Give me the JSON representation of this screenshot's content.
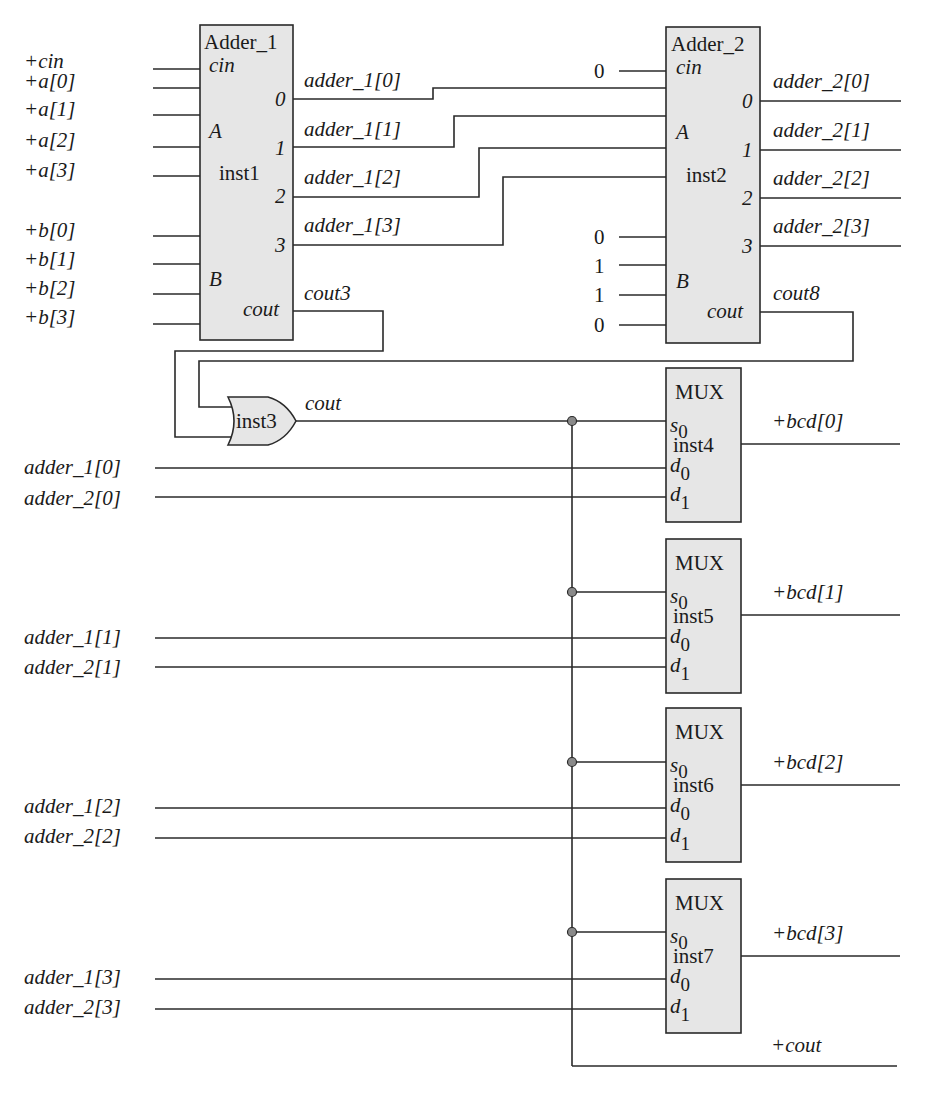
{
  "diagram": {
    "colors": {
      "block_fill": "#e6e6e6",
      "wire": "#2a2a2a",
      "junction": "#8a8a8a"
    },
    "inputs_left": [
      "+cin",
      "+a[0]",
      "+a[1]",
      "+a[2]",
      "+a[3]",
      "+b[0]",
      "+b[1]",
      "+b[2]",
      "+b[3]"
    ],
    "adder1": {
      "title": "Adder_1",
      "instance": "inst1",
      "pin_cin": "cin",
      "pin_a": "A",
      "pin_b": "B",
      "pin_cout": "cout",
      "out_pins": [
        "0",
        "1",
        "2",
        "3"
      ],
      "out_nets": [
        "adder_1[0]",
        "adder_1[1]",
        "adder_1[2]",
        "adder_1[3]"
      ],
      "cout_net": "cout3"
    },
    "adder2": {
      "title": "Adder_2",
      "instance": "inst2",
      "pin_cin": "cin",
      "pin_a": "A",
      "pin_b": "B",
      "pin_cout": "cout",
      "cin_const": "0",
      "b_consts": [
        "0",
        "1",
        "1",
        "0"
      ],
      "out_pins": [
        "0",
        "1",
        "2",
        "3"
      ],
      "out_nets": [
        "adder_2[0]",
        "adder_2[1]",
        "adder_2[2]",
        "adder_2[3]"
      ],
      "cout_net": "cout8"
    },
    "or_gate": {
      "instance": "inst3",
      "out_net": "cout"
    },
    "muxes": [
      {
        "title": "MUX",
        "instance": "inst4",
        "s": "s",
        "d0": "d",
        "d1": "d",
        "sub0": "0",
        "sub1": "1",
        "in0": "adder_1[0]",
        "in1": "adder_2[0]",
        "output": "+bcd[0]"
      },
      {
        "title": "MUX",
        "instance": "inst5",
        "s": "s",
        "d0": "d",
        "d1": "d",
        "sub0": "0",
        "sub1": "1",
        "in0": "adder_1[1]",
        "in1": "adder_2[1]",
        "output": "+bcd[1]"
      },
      {
        "title": "MUX",
        "instance": "inst6",
        "s": "s",
        "d0": "d",
        "d1": "d",
        "sub0": "0",
        "sub1": "1",
        "in0": "adder_1[2]",
        "in1": "adder_2[2]",
        "output": "+bcd[2]"
      },
      {
        "title": "MUX",
        "instance": "inst7",
        "s": "s",
        "d0": "d",
        "d1": "d",
        "sub0": "0",
        "sub1": "1",
        "in0": "adder_1[3]",
        "in1": "adder_2[3]",
        "output": "+bcd[3]"
      }
    ],
    "final_output": "+cout"
  }
}
